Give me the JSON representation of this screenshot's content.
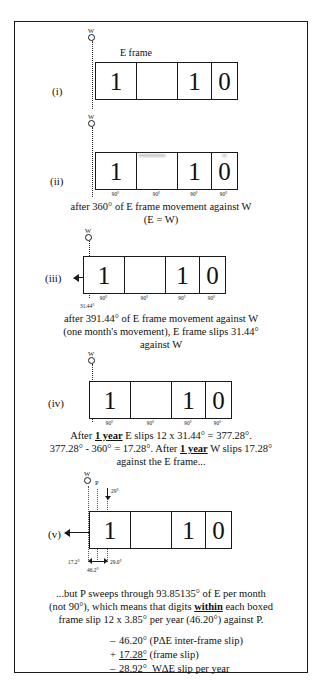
{
  "figure": {
    "title_label": "E frame",
    "marker_w": "W",
    "marker_p": "P",
    "tick_90": "90°"
  },
  "rows": [
    {
      "id": "i",
      "label": "(i)",
      "digits": [
        "1",
        "",
        "1",
        "0"
      ],
      "has_ticks": false,
      "has_arrow": false,
      "marker": "W"
    },
    {
      "id": "ii",
      "label": "(ii)",
      "digits": [
        "1",
        "",
        "1",
        "0"
      ],
      "has_ticks": true,
      "has_arrow": false,
      "marker": "W",
      "caption_line1": "after 360° of E frame movement against W",
      "caption_line2": "(E = W)"
    },
    {
      "id": "iii",
      "label": "(iii)",
      "digits": [
        "1",
        "",
        "1",
        "0"
      ],
      "has_ticks": true,
      "has_arrow": true,
      "marker": "W",
      "slip_label": "31.44°",
      "caption_line1": "after 391.44° of E frame movement against W",
      "caption_line2": "(one month's movement), E frame slips 31.44°",
      "caption_line3": "against W"
    },
    {
      "id": "iv",
      "label": "(iv)",
      "digits": [
        "1",
        "",
        "1",
        "0"
      ],
      "has_ticks": true,
      "has_arrow": false,
      "marker": "W"
    },
    {
      "id": "v",
      "label": "(v)",
      "digits": [
        "1",
        "",
        "1",
        "0"
      ],
      "has_ticks": false,
      "has_arrow": true,
      "marker": "W",
      "p_angle": "29°",
      "measure_left": "17.2°",
      "measure_right": "29.0°",
      "measure_total": "46.2°"
    }
  ],
  "captions": {
    "after_iv_line1_a": "After ",
    "after_iv_line1_u": "1 year",
    "after_iv_line1_b": " E slips 12 x 31.44° = 377.28°.",
    "after_iv_line2_a": "377.28° - 360° = 17.28°. After ",
    "after_iv_line2_u": "1 year",
    "after_iv_line2_b": " W slips 17.28°",
    "after_iv_line3": "against the E frame...",
    "final_line1": "...but P sweeps through 93.85135° of E per month",
    "final_line2_a": "(not 90°), which means that digits ",
    "final_line2_u": "within",
    "final_line2_b": " each boxed",
    "final_line3": "frame slip 12 x 3.85° per year (46.20°) against P."
  },
  "equations": [
    {
      "op": "–",
      "value": "46.20°",
      "desc": "(PΔE inter-frame slip)",
      "style": "plain"
    },
    {
      "op": "+",
      "value": "17.28°",
      "desc": "(frame slip)",
      "style": "underline"
    },
    {
      "op": "–",
      "value": "28.92°",
      "desc": "WΔE slip per year",
      "style": "overline"
    }
  ],
  "colors": {
    "ink": "#1a1a1a",
    "paper": "#ffffff"
  }
}
